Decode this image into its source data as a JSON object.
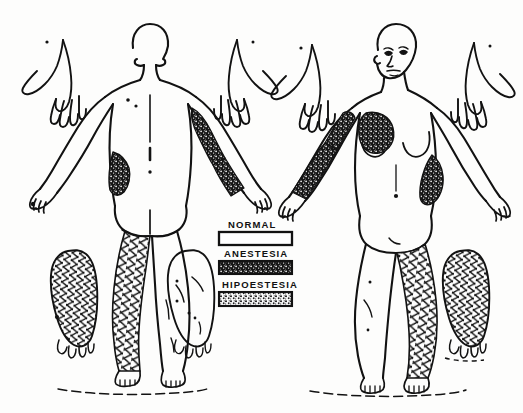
{
  "diagram": {
    "background_color": "#fdfdfc",
    "ink_color": "#121212"
  },
  "legend": {
    "name": "sensory-legend",
    "items": [
      {
        "label": "NORMAL",
        "pattern": "blank",
        "swatch_fill": "#ffffff"
      },
      {
        "label": "ANESTESIA",
        "pattern": "dense-stipple",
        "swatch_fill": "#1a1a1a"
      },
      {
        "label": "HIPOESTESIA",
        "pattern": "light-stipple",
        "swatch_fill": "#6e6e6e"
      }
    ]
  },
  "figures": [
    {
      "name": "posterior-figure",
      "view": "posterior",
      "caption": "",
      "regions": [
        {
          "name": "left-upper-arm-posterior",
          "pattern": "dense-stipple",
          "finding": "ANESTESIA"
        },
        {
          "name": "left-forearm-posterior",
          "pattern": "dense-stipple",
          "finding": "ANESTESIA"
        },
        {
          "name": "right-flank-posterior",
          "pattern": "dense-stipple",
          "finding": "ANESTESIA"
        },
        {
          "name": "right-leg-posterior",
          "pattern": "crosshatch",
          "finding": "HIPOESTESIA"
        }
      ]
    },
    {
      "name": "anterior-figure",
      "view": "anterior",
      "caption": "",
      "regions": [
        {
          "name": "right-breast-anterior",
          "pattern": "dense-stipple",
          "finding": "ANESTESIA"
        },
        {
          "name": "right-arm-anterior",
          "pattern": "dense-stipple",
          "finding": "ANESTESIA"
        },
        {
          "name": "left-flank-anterior",
          "pattern": "dense-stipple",
          "finding": "ANESTESIA"
        },
        {
          "name": "left-leg-anterior",
          "pattern": "crosshatch",
          "finding": "HIPOESTESIA"
        }
      ]
    }
  ],
  "hands": [
    {
      "name": "hand-posterior-left",
      "pattern": "blank",
      "finding": "NORMAL"
    },
    {
      "name": "hand-posterior-right",
      "pattern": "blank",
      "finding": "NORMAL"
    },
    {
      "name": "hand-anterior-left",
      "pattern": "blank",
      "finding": "NORMAL"
    },
    {
      "name": "hand-anterior-right",
      "pattern": "blank",
      "finding": "NORMAL"
    }
  ],
  "feet": [
    {
      "name": "foot-sole-affected-left",
      "pattern": "crosshatch",
      "finding": "HIPOESTESIA"
    },
    {
      "name": "foot-sole-normal-left",
      "pattern": "blank",
      "finding": "NORMAL"
    },
    {
      "name": "foot-sole-normal-right",
      "pattern": "blank",
      "finding": "NORMAL"
    },
    {
      "name": "foot-sole-affected-right",
      "pattern": "crosshatch",
      "finding": "HIPOESTESIA"
    }
  ]
}
